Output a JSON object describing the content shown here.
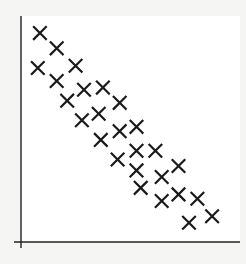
{
  "chart_data": {
    "type": "scatter",
    "title": "",
    "xlabel": "",
    "ylabel": "",
    "marker": "x",
    "grid": false,
    "legend": null,
    "xlim": [
      0,
      10
    ],
    "ylim": [
      0,
      10
    ],
    "points": [
      {
        "x": 0.9,
        "y": 9.4
      },
      {
        "x": 1.7,
        "y": 8.7
      },
      {
        "x": 0.8,
        "y": 7.8
      },
      {
        "x": 2.6,
        "y": 7.9
      },
      {
        "x": 1.7,
        "y": 7.2
      },
      {
        "x": 3.0,
        "y": 6.8
      },
      {
        "x": 3.9,
        "y": 6.9
      },
      {
        "x": 2.2,
        "y": 6.3
      },
      {
        "x": 4.7,
        "y": 6.2
      },
      {
        "x": 2.9,
        "y": 5.4
      },
      {
        "x": 3.7,
        "y": 5.7
      },
      {
        "x": 5.5,
        "y": 5.1
      },
      {
        "x": 4.7,
        "y": 4.9
      },
      {
        "x": 3.8,
        "y": 4.5
      },
      {
        "x": 5.5,
        "y": 4.0
      },
      {
        "x": 6.4,
        "y": 4.0
      },
      {
        "x": 4.6,
        "y": 3.6
      },
      {
        "x": 5.5,
        "y": 3.1
      },
      {
        "x": 6.7,
        "y": 2.8
      },
      {
        "x": 7.5,
        "y": 3.3
      },
      {
        "x": 5.7,
        "y": 2.3
      },
      {
        "x": 6.7,
        "y": 1.7
      },
      {
        "x": 7.5,
        "y": 2.0
      },
      {
        "x": 8.4,
        "y": 1.8
      },
      {
        "x": 9.1,
        "y": 1.0
      },
      {
        "x": 8.0,
        "y": 0.7
      }
    ]
  },
  "style": {
    "axis_color": "#222222",
    "marker_color": "#1a1a1a",
    "plot_bg": "#ffffff"
  }
}
